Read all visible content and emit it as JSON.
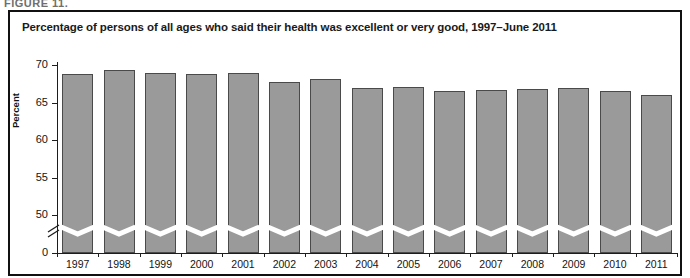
{
  "figure_stub": "FIGURE 11.",
  "frame": {
    "border_color": "#111111"
  },
  "title": "Percentage of persons of all ages who said their health was excellent or very good, 1997–June 2011",
  "axis": {
    "y_label": "Percent",
    "y_ticks": [
      "70",
      "65",
      "60",
      "55",
      "50",
      "0"
    ]
  },
  "colors": {
    "bar_fill": "#9a9a9a",
    "bar_stroke": "#4a4a4a",
    "axis": "#1d1d1d",
    "text": "#141414",
    "background": "#ffffff"
  },
  "chart_data": {
    "type": "bar",
    "title": "Percentage of persons of all ages who said their health was excellent or very good, 1997–June 2011",
    "xlabel": "",
    "ylabel": "Percent",
    "ylim": [
      0,
      70
    ],
    "y_ticks": [
      0,
      50,
      55,
      60,
      65,
      70
    ],
    "axis_break": {
      "between": [
        0,
        50
      ],
      "style": "zigzag"
    },
    "grid": false,
    "legend": null,
    "categories": [
      "1997",
      "1998",
      "1999",
      "2000",
      "2001",
      "2002",
      "2003",
      "2004",
      "2005",
      "2006",
      "2007",
      "2008",
      "2009",
      "2010",
      "2011"
    ],
    "values": [
      68.8,
      69.4,
      69.0,
      68.8,
      68.9,
      67.8,
      68.1,
      67.0,
      67.1,
      66.5,
      66.7,
      66.8,
      66.9,
      66.5,
      66.0
    ]
  }
}
